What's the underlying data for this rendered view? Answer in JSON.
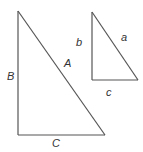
{
  "figure": {
    "type": "similar right triangles",
    "large_triangle": {
      "labels": {
        "hypotenuse": "A",
        "vertical_leg": "B",
        "horizontal_leg": "C"
      }
    },
    "small_triangle": {
      "labels": {
        "hypotenuse": "a",
        "vertical_leg": "b",
        "horizontal_leg": "c"
      }
    },
    "line_color": "#555555",
    "label_color": "#333333"
  }
}
